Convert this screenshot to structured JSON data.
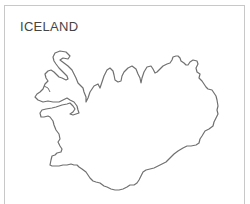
{
  "map": {
    "title": "ICELAND",
    "outline_stroke": "#6e6e6e",
    "border_color": "#c8c8c8"
  }
}
